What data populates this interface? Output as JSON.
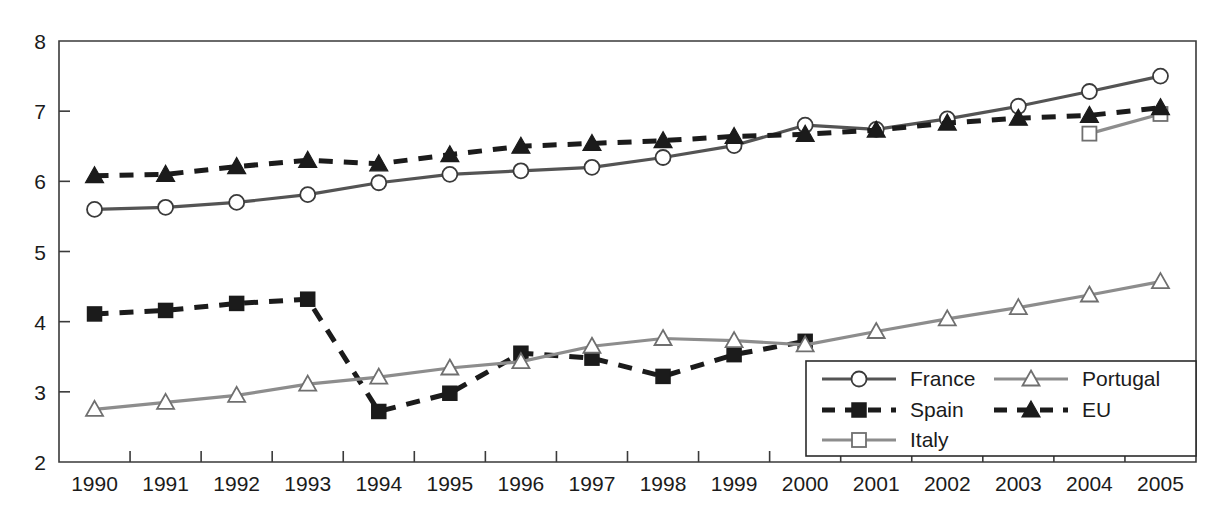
{
  "chart_data": {
    "type": "line",
    "title": "",
    "xlabel": "",
    "ylabel": "",
    "categories": [
      "1990",
      "1991",
      "1992",
      "1993",
      "1994",
      "1995",
      "1996",
      "1997",
      "1998",
      "1999",
      "2000",
      "2001",
      "2002",
      "2003",
      "2004",
      "2005"
    ],
    "x_tick_labels": [
      "1990",
      "1991",
      "1992",
      "1993",
      "1994",
      "1995",
      "1996",
      "1997",
      "1998",
      "1999",
      "2000",
      "2001",
      "2002",
      "2003",
      "2004",
      "2005"
    ],
    "y_tick_labels": [
      "2",
      "3",
      "4",
      "5",
      "6",
      "7",
      "8"
    ],
    "y_ticks": [
      2,
      3,
      4,
      5,
      6,
      7,
      8
    ],
    "ylim": [
      2,
      8
    ],
    "grid": false,
    "legend_position": "bottom-right",
    "series": [
      {
        "name": "France",
        "marker": "circle-open",
        "line_style": "solid",
        "color": "#545454",
        "marker_fill": "#ffffff",
        "values": [
          5.6,
          5.63,
          5.7,
          5.81,
          5.98,
          6.1,
          6.15,
          6.2,
          6.34,
          6.51,
          6.8,
          6.74,
          6.89,
          7.07,
          7.28,
          7.5
        ]
      },
      {
        "name": "Spain",
        "marker": "square-filled",
        "line_style": "dashed",
        "color": "#1b1b1b",
        "marker_fill": "#1b1b1b",
        "values": [
          4.11,
          4.16,
          4.26,
          4.32,
          2.72,
          2.98,
          3.55,
          3.48,
          3.22,
          3.53,
          3.72,
          null,
          null,
          null,
          null,
          null
        ]
      },
      {
        "name": "Italy",
        "marker": "square-open",
        "line_style": "solid",
        "color": "#8d8d8d",
        "marker_fill": "#ffffff",
        "values": [
          null,
          null,
          null,
          null,
          null,
          null,
          null,
          null,
          null,
          null,
          null,
          null,
          null,
          null,
          6.68,
          6.96
        ]
      },
      {
        "name": "Portugal",
        "marker": "triangle-open",
        "line_style": "solid",
        "color": "#8d8d8d",
        "marker_fill": "#ffffff",
        "values": [
          2.75,
          2.85,
          2.95,
          3.11,
          3.21,
          3.34,
          3.43,
          3.65,
          3.76,
          3.73,
          3.67,
          3.86,
          4.04,
          4.2,
          4.38,
          4.57
        ]
      },
      {
        "name": "EU",
        "marker": "triangle-filled",
        "line_style": "dashed",
        "color": "#1b1b1b",
        "marker_fill": "#1b1b1b",
        "values": [
          6.08,
          6.1,
          6.21,
          6.3,
          6.25,
          6.38,
          6.5,
          6.54,
          6.58,
          6.64,
          6.67,
          6.73,
          6.83,
          6.9,
          6.94,
          7.05
        ]
      }
    ],
    "legend": [
      {
        "label": "France",
        "series": "France"
      },
      {
        "label": "Portugal",
        "series": "Portugal"
      },
      {
        "label": "Spain",
        "series": "Spain"
      },
      {
        "label": "EU",
        "series": "EU"
      },
      {
        "label": "Italy",
        "series": "Italy"
      }
    ]
  }
}
